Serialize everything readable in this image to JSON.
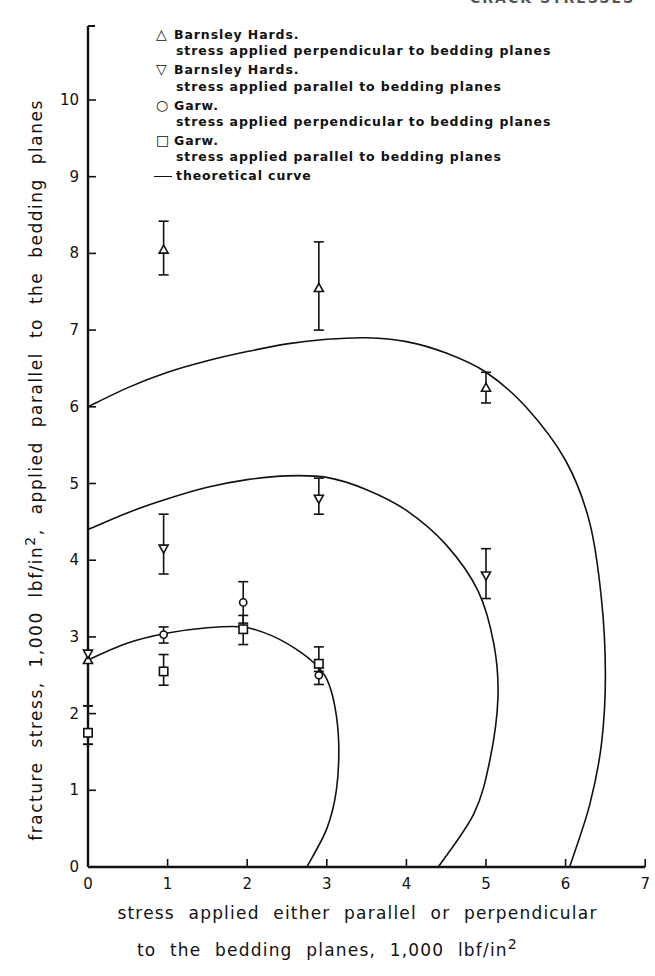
{
  "header_fragment": "CRACK STRESSES",
  "chart_data": {
    "type": "scatter",
    "title": "",
    "xlabel": "stress applied either parallel or perpendicular to the bedding planes, 1,000 lbf/in²",
    "xlabel_line1": "stress applied either parallel or perpendicular",
    "xlabel_line2": "to the bedding planes, 1,000 lbf/in",
    "xlabel_sup": "2",
    "ylabel": "fracture stress, 1,000 lbf/in², applied parallel to the bedding planes",
    "ylabel_pre": "fracture stress, 1,000 lbf/in",
    "ylabel_sup": "2",
    "ylabel_post": ", applied parallel to the bedding planes",
    "xlim": [
      0,
      7
    ],
    "ylim": [
      0,
      11
    ],
    "xticks": [
      "0",
      "1",
      "2",
      "3",
      "4",
      "5",
      "6",
      "7"
    ],
    "yticks": [
      "0",
      "1",
      "2",
      "3",
      "4",
      "5",
      "6",
      "7",
      "8",
      "9",
      "10"
    ],
    "grid": false,
    "legend_position": "top-right inside",
    "legend": [
      {
        "symbol": "△",
        "name": "Barnsley Hards.",
        "desc": "stress applied perpendicular to bedding planes"
      },
      {
        "symbol": "▽",
        "name": "Barnsley Hards.",
        "desc": "stress applied parallel to bedding planes"
      },
      {
        "symbol": "○",
        "name": "Garw.",
        "desc": "stress applied perpendicular to bedding planes"
      },
      {
        "symbol": "□",
        "name": "Garw.",
        "desc": "stress applied parallel to bedding planes"
      },
      {
        "symbol": "—",
        "name": "theoretical curve",
        "desc": ""
      }
    ],
    "series": [
      {
        "name": "Barnsley Hards. stress applied perpendicular to bedding planes",
        "marker": "triangle-up",
        "points": [
          {
            "x": 0,
            "y": 2.7,
            "ylo": 2.7,
            "yhi": 2.7
          },
          {
            "x": 0.95,
            "y": 8.05,
            "ylo": 7.72,
            "yhi": 8.42
          },
          {
            "x": 2.9,
            "y": 7.55,
            "ylo": 7.0,
            "yhi": 8.15
          },
          {
            "x": 5.0,
            "y": 6.25,
            "ylo": 6.05,
            "yhi": 6.45
          }
        ]
      },
      {
        "name": "Barnsley Hards. stress applied parallel to bedding planes",
        "marker": "triangle-down",
        "points": [
          {
            "x": 0,
            "y": 2.78,
            "ylo": 2.78,
            "yhi": 2.78
          },
          {
            "x": 0.95,
            "y": 4.15,
            "ylo": 3.82,
            "yhi": 4.6
          },
          {
            "x": 2.9,
            "y": 4.8,
            "ylo": 4.6,
            "yhi": 5.07
          },
          {
            "x": 5.0,
            "y": 3.8,
            "ylo": 3.5,
            "yhi": 4.15
          }
        ]
      },
      {
        "name": "Garw. stress applied perpendicular to bedding planes",
        "marker": "circle",
        "points": [
          {
            "x": 0,
            "y": 1.75,
            "ylo": 1.6,
            "yhi": 2.1
          },
          {
            "x": 0.95,
            "y": 3.03,
            "ylo": 2.92,
            "yhi": 3.13
          },
          {
            "x": 1.95,
            "y": 3.45,
            "ylo": 3.18,
            "yhi": 3.72
          },
          {
            "x": 2.9,
            "y": 2.5,
            "ylo": 2.38,
            "yhi": 2.6
          }
        ]
      },
      {
        "name": "Garw. stress applied parallel to bedding planes",
        "marker": "square",
        "points": [
          {
            "x": 0,
            "y": 1.75,
            "ylo": 1.6,
            "yhi": 2.1
          },
          {
            "x": 0.95,
            "y": 2.55,
            "ylo": 2.37,
            "yhi": 2.77
          },
          {
            "x": 1.95,
            "y": 3.1,
            "ylo": 2.9,
            "yhi": 3.28
          },
          {
            "x": 2.9,
            "y": 2.65,
            "ylo": 2.55,
            "yhi": 2.87
          }
        ]
      }
    ],
    "theoretical_curves": [
      {
        "name": "outer (Barnsley Hards perpendicular)",
        "points": [
          [
            0,
            6.0
          ],
          [
            0.5,
            6.25
          ],
          [
            1,
            6.45
          ],
          [
            1.5,
            6.6
          ],
          [
            2,
            6.72
          ],
          [
            2.5,
            6.82
          ],
          [
            3,
            6.88
          ],
          [
            3.5,
            6.9
          ],
          [
            4,
            6.85
          ],
          [
            4.5,
            6.7
          ],
          [
            5,
            6.45
          ],
          [
            5.5,
            6.0
          ],
          [
            6,
            5.3
          ],
          [
            6.3,
            4.5
          ],
          [
            6.45,
            3.5
          ],
          [
            6.5,
            2.5
          ],
          [
            6.45,
            1.6
          ],
          [
            6.3,
            0.8
          ],
          [
            6.05,
            0
          ]
        ]
      },
      {
        "name": "middle (Barnsley Hards parallel)",
        "points": [
          [
            0,
            4.4
          ],
          [
            0.5,
            4.62
          ],
          [
            1,
            4.8
          ],
          [
            1.5,
            4.95
          ],
          [
            2,
            5.05
          ],
          [
            2.5,
            5.1
          ],
          [
            3,
            5.08
          ],
          [
            3.5,
            4.92
          ],
          [
            4,
            4.65
          ],
          [
            4.5,
            4.2
          ],
          [
            4.9,
            3.6
          ],
          [
            5.1,
            2.9
          ],
          [
            5.15,
            2.2
          ],
          [
            5.05,
            1.4
          ],
          [
            4.85,
            0.7
          ],
          [
            4.4,
            0
          ]
        ]
      },
      {
        "name": "inner (Garw)",
        "points": [
          [
            0,
            2.7
          ],
          [
            0.5,
            2.92
          ],
          [
            1,
            3.05
          ],
          [
            1.5,
            3.12
          ],
          [
            1.95,
            3.13
          ],
          [
            2.3,
            3.02
          ],
          [
            2.6,
            2.85
          ],
          [
            2.85,
            2.65
          ],
          [
            3.0,
            2.45
          ],
          [
            3.1,
            2.1
          ],
          [
            3.15,
            1.6
          ],
          [
            3.12,
            1.0
          ],
          [
            3.0,
            0.5
          ],
          [
            2.75,
            0
          ]
        ]
      }
    ]
  }
}
